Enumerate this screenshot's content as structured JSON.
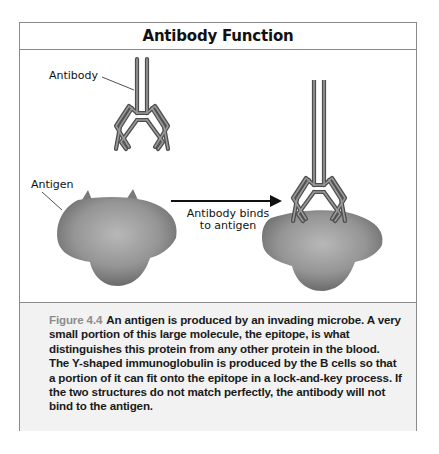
{
  "title": "Antibody Function",
  "figure": {
    "labels": {
      "antibody": "Antibody",
      "antigen": "Antigen",
      "arrow_line1": "Antibody binds",
      "arrow_line2": "to antigen"
    },
    "credit": "© Infobase Learning",
    "colors": {
      "antibody_stroke": "#555555",
      "antigen_light": "#b5b5b5",
      "antigen_dark": "#666666",
      "arrow": "#111111"
    }
  },
  "caption": {
    "figure_label": "Figure 4.4",
    "text": "An antigen is produced by an invading microbe. A very small portion of this large molecule, the epitope, is what distinguishes this protein from any other protein in the blood. The Y-shaped immunoglobulin is produced by the B cells so that a portion of it can fit onto the epitope in a lock-and-key process. If the two structures do not match perfectly, the antibody will not bind to the antigen."
  }
}
